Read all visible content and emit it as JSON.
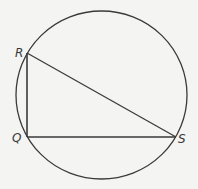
{
  "diagram": {
    "type": "geometry",
    "colors": {
      "background": "#f4f4f2",
      "stroke": "#3a3a3a"
    },
    "circle": {
      "cx": 101.5,
      "cy": 95,
      "rx": 85.5,
      "ry": 84
    },
    "points": {
      "R": {
        "label": "R",
        "x": 27,
        "y": 53,
        "label_x": 15,
        "label_y": 57
      },
      "Q": {
        "label": "Q",
        "x": 27,
        "y": 137,
        "label_x": 12,
        "label_y": 142
      },
      "S": {
        "label": "S",
        "x": 176,
        "y": 137,
        "label_x": 178,
        "label_y": 143
      }
    },
    "segments": [
      {
        "name": "RQ",
        "from": "R",
        "to": "Q"
      },
      {
        "name": "QS",
        "from": "Q",
        "to": "S"
      },
      {
        "name": "RS",
        "from": "R",
        "to": "S"
      }
    ]
  }
}
